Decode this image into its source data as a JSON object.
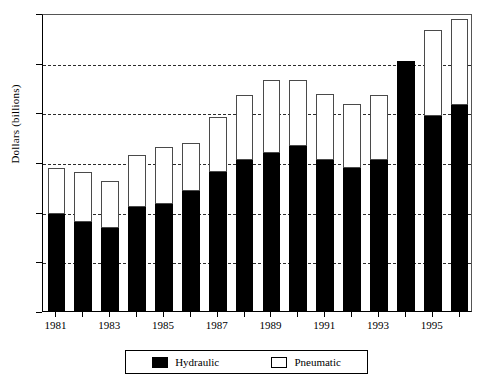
{
  "chart_data": {
    "type": "bar",
    "subtype": "stacked-vertical",
    "title": "",
    "xlabel": "",
    "ylabel": "Dollars (billions)",
    "ylim": [
      0,
      12
    ],
    "ytick_step": 2,
    "yticks": [
      0,
      2,
      4,
      6,
      8,
      10,
      12
    ],
    "ytick_labels": [
      "0",
      "2",
      "4",
      "6",
      "8",
      "10",
      "12"
    ],
    "grid": "horizontal-dashed",
    "categories": [
      1981,
      1982,
      1983,
      1984,
      1985,
      1986,
      1987,
      1988,
      1989,
      1990,
      1991,
      1992,
      1993,
      1994,
      1995,
      1996
    ],
    "xtick_labels": [
      "1981",
      "",
      "1983",
      "",
      "1985",
      "",
      "1987",
      "",
      "1989",
      "",
      "1991",
      "",
      "1993",
      "",
      "1995",
      ""
    ],
    "visible_xtick_labels": [
      "1981",
      "1983",
      "1985",
      "1987",
      "1989",
      "1991",
      "1993",
      "1995"
    ],
    "series": [
      {
        "name": "Hydraulic",
        "color": "#000000",
        "fill": "solid-black",
        "values": [
          3.9,
          3.6,
          3.35,
          4.2,
          4.3,
          4.85,
          5.6,
          6.1,
          6.35,
          6.65,
          6.1,
          5.75,
          6.1,
          10.05,
          7.85,
          8.3
        ]
      },
      {
        "name": "Pneumatic",
        "color": "#ffffff",
        "fill": "white-outline",
        "values": [
          1.85,
          2.0,
          1.9,
          2.1,
          2.3,
          1.9,
          2.2,
          2.6,
          2.95,
          2.65,
          2.65,
          2.6,
          2.6,
          0.0,
          3.45,
          3.45
        ]
      }
    ],
    "totals": [
      5.75,
      5.6,
      5.25,
      6.3,
      6.6,
      6.75,
      7.8,
      8.7,
      9.3,
      9.3,
      8.75,
      8.35,
      8.7,
      10.05,
      11.3,
      11.75
    ],
    "legend_position": "below-center"
  },
  "legend": {
    "entries": [
      {
        "label": "Hydraulic",
        "swatch": "filled"
      },
      {
        "label": "Pneumatic",
        "swatch": "hollow"
      }
    ]
  },
  "axes": {
    "y_title": "Dollars (billions)"
  }
}
